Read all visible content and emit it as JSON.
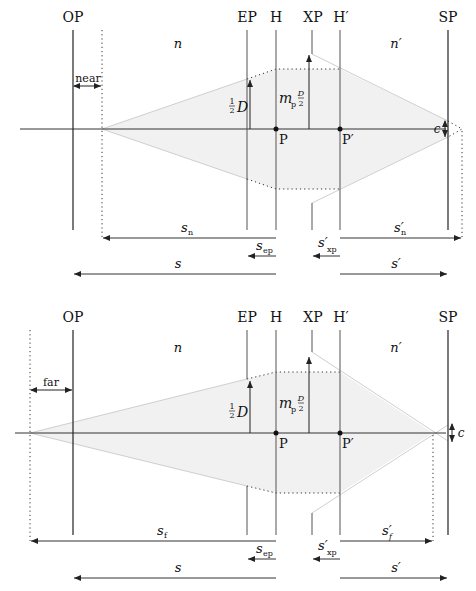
{
  "diagrams": [
    {
      "id": "near",
      "planes": {
        "OP": "OP",
        "EP": "EP",
        "H": "H",
        "XP": "XP",
        "Hp": "H′",
        "SP": "SP"
      },
      "media": {
        "object": "n",
        "image": "n′"
      },
      "points": {
        "P": "P",
        "Pp": "P′"
      },
      "limit_label": "near",
      "aperture_label": {
        "half": "1",
        "den": "2",
        "sym": "D"
      },
      "pupil_label": {
        "m": "m",
        "sub": "p",
        "num": "D",
        "den": "2"
      },
      "coc_label": "c",
      "distances": {
        "limit": {
          "sym": "s",
          "sub": "n"
        },
        "limit_img": {
          "sym": "s′",
          "sub": "n"
        },
        "ep": {
          "sym": "s",
          "sub": "ep"
        },
        "xp": {
          "sym": "s′",
          "sub": "xp"
        },
        "obj": {
          "sym": "s"
        },
        "img": {
          "sym": "s′"
        }
      }
    },
    {
      "id": "far",
      "planes": {
        "OP": "OP",
        "EP": "EP",
        "H": "H",
        "XP": "XP",
        "Hp": "H′",
        "SP": "SP"
      },
      "media": {
        "object": "n",
        "image": "n′"
      },
      "points": {
        "P": "P",
        "Pp": "P′"
      },
      "limit_label": "far",
      "aperture_label": {
        "half": "1",
        "den": "2",
        "sym": "D"
      },
      "pupil_label": {
        "m": "m",
        "sub": "p",
        "num": "D",
        "den": "2"
      },
      "coc_label": "c",
      "distances": {
        "limit": {
          "sym": "s",
          "sub": "f"
        },
        "limit_img": {
          "sym": "s′",
          "sub": "f"
        },
        "ep": {
          "sym": "s",
          "sub": "ep"
        },
        "xp": {
          "sym": "s′",
          "sub": "xp"
        },
        "obj": {
          "sym": "s"
        },
        "img": {
          "sym": "s′"
        }
      }
    }
  ],
  "colors": {
    "line": "#222222",
    "plane": "#555555",
    "ray": "#cfcfcf",
    "shade": "#f2f2f2",
    "dotted": "#333333"
  }
}
